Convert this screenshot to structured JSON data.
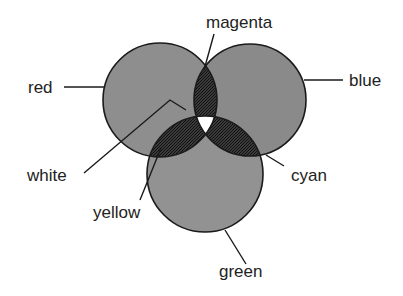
{
  "diagram": {
    "type": "venn",
    "circles": [
      {
        "label": "red",
        "cx": 160,
        "cy": 100,
        "r": 57
      },
      {
        "label": "blue",
        "cx": 250,
        "cy": 100,
        "r": 56
      },
      {
        "label": "green",
        "cx": 205,
        "cy": 174,
        "r": 58
      }
    ],
    "labels": {
      "magenta": "magenta",
      "red": "red",
      "blue": "blue",
      "white": "white",
      "cyan": "cyan",
      "yellow": "yellow",
      "green": "green"
    },
    "colors": {
      "circle_fill": "#8c8c8c",
      "overlap_fill": "#2e2e2e",
      "center_fill": "#ffffff",
      "stroke": "#1a1a1a"
    }
  }
}
